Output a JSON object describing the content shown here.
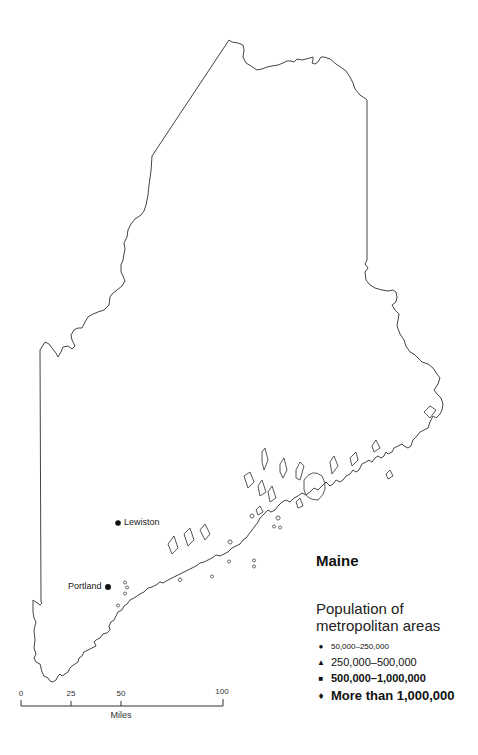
{
  "map": {
    "state_name": "Maine",
    "outline_color": "#444444",
    "cities": [
      {
        "name": "Lewiston",
        "category": "50,000-250,000",
        "label_side": "right"
      },
      {
        "name": "Portland",
        "category": "50,000-250,000",
        "label_side": "left"
      }
    ]
  },
  "legend": {
    "title": "Population of metropolitan areas",
    "items": [
      {
        "symbol": "●",
        "label": "50,000–250,000",
        "symbol_name": "circle"
      },
      {
        "symbol": "▲",
        "label": "250,000–500,000",
        "symbol_name": "triangle"
      },
      {
        "symbol": "■",
        "label": "500,000–1,000,000",
        "symbol_name": "square"
      },
      {
        "symbol": "♦",
        "label": "More than 1,000,000",
        "symbol_name": "diamond"
      }
    ]
  },
  "scale_bar": {
    "ticks": [
      "0",
      "25",
      "50",
      "100"
    ],
    "unit": "Miles"
  }
}
